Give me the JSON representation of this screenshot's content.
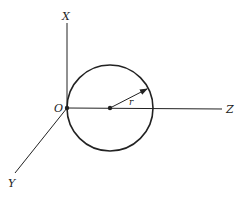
{
  "diagram": {
    "type": "3d-axes-circle",
    "labels": {
      "x_axis": "X",
      "y_axis": "Y",
      "z_axis": "Z",
      "origin": "O",
      "radius": "r"
    },
    "colors": {
      "stroke": "#222222",
      "background": "#ffffff"
    }
  }
}
